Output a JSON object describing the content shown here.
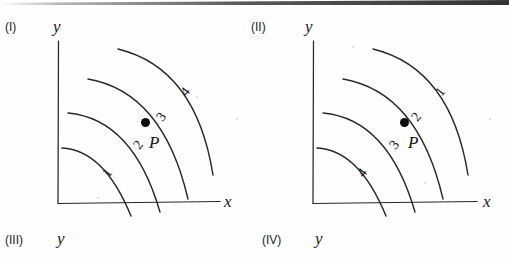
{
  "figure": {
    "background_color": "#fefefe",
    "ink_color": "#17171a",
    "panels": [
      {
        "id": "panel-I",
        "roman_label": "(I)",
        "y_axis_label": "y",
        "x_axis_label": "x",
        "point_label": "P",
        "contour_labels": [
          "1",
          "2",
          "3",
          "4"
        ],
        "label_order_from_inner_to_outer": [
          "1",
          "2",
          "3",
          "4"
        ],
        "label_positions": {
          "1": {
            "x": 104,
            "y": 165,
            "rotation": -52
          },
          "2": {
            "x": 135,
            "y": 137,
            "rotation": -52
          },
          "3": {
            "x": 158,
            "y": 109,
            "rotation": -52
          },
          "4": {
            "x": 182,
            "y": 84,
            "rotation": -52
          }
        },
        "point_position": {
          "x": 141,
          "y": 118
        },
        "point_text_position": {
          "x": 149,
          "y": 133
        }
      },
      {
        "id": "panel-II",
        "roman_label": "(II)",
        "y_axis_label": "y",
        "x_axis_label": "x",
        "point_label": "P",
        "contour_labels": [
          "4",
          "3",
          "2",
          "1"
        ],
        "label_order_from_inner_to_outer": [
          "4",
          "3",
          "2",
          "1"
        ],
        "label_positions": {
          "4": {
            "x": 359,
            "y": 165,
            "rotation": -52
          },
          "3": {
            "x": 391,
            "y": 137,
            "rotation": -52
          },
          "2": {
            "x": 413,
            "y": 109,
            "rotation": -52
          },
          "1": {
            "x": 437,
            "y": 84,
            "rotation": -52
          }
        },
        "point_position": {
          "x": 400,
          "y": 118
        },
        "point_text_position": {
          "x": 408,
          "y": 133
        }
      },
      {
        "id": "panel-III",
        "roman_label": "(III)",
        "y_axis_label": "y"
      },
      {
        "id": "panel-IV",
        "roman_label": "(IV)",
        "y_axis_label": "y"
      }
    ]
  }
}
